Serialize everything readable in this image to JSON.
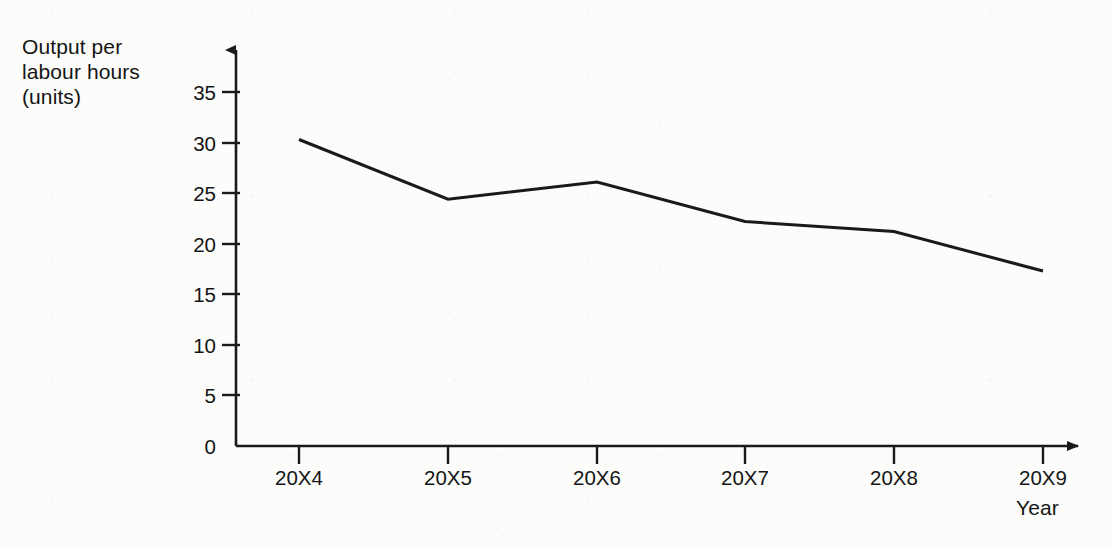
{
  "chart_data": {
    "type": "line",
    "title": "",
    "subtitle": "",
    "xlabel": "Year",
    "ylabel": "Output per labour hours\n(units)",
    "categories": [
      "20X4",
      "20X5",
      "20X6",
      "20X7",
      "20X8",
      "20X9"
    ],
    "series": [
      {
        "name": "Output per labour hours (units)",
        "values": [
          30.3,
          24.4,
          26.1,
          22.2,
          21.2,
          17.3
        ]
      }
    ],
    "x_tick_labels": [
      "20X4",
      "20X5",
      "20X6",
      "20X7",
      "20X8",
      "20X9"
    ],
    "y_tick_labels": [
      "0",
      "5",
      "10",
      "15",
      "20",
      "25",
      "30",
      "35"
    ],
    "y_ticks": [
      0,
      5,
      10,
      15,
      20,
      25,
      30,
      35
    ],
    "ylim": [
      0,
      37
    ],
    "xlim": [
      0,
      7
    ],
    "grid": false,
    "legend": false,
    "legend_position": "none",
    "markers": false,
    "line_color": "#1a1a1a",
    "line_width": 3,
    "axis_color": "#1a1a1a",
    "background_color": "#fcfcfb",
    "axes_style": "arrow-tipped open axes, ticks outside"
  },
  "axis_labels": {
    "y_title": "Output per\nlabour hours\n(units)",
    "x_title": "Year"
  },
  "y_axis": {
    "ticks": [
      {
        "label": "35",
        "value": 35
      },
      {
        "label": "30",
        "value": 30
      },
      {
        "label": "25",
        "value": 25
      },
      {
        "label": "20",
        "value": 20
      },
      {
        "label": "15",
        "value": 15
      },
      {
        "label": "10",
        "value": 10
      },
      {
        "label": "5",
        "value": 5
      },
      {
        "label": "0",
        "value": 0
      }
    ]
  },
  "x_axis": {
    "ticks": [
      {
        "label": "20X4"
      },
      {
        "label": "20X5"
      },
      {
        "label": "20X6"
      },
      {
        "label": "20X7"
      },
      {
        "label": "20X8"
      },
      {
        "label": "20X9"
      }
    ]
  }
}
